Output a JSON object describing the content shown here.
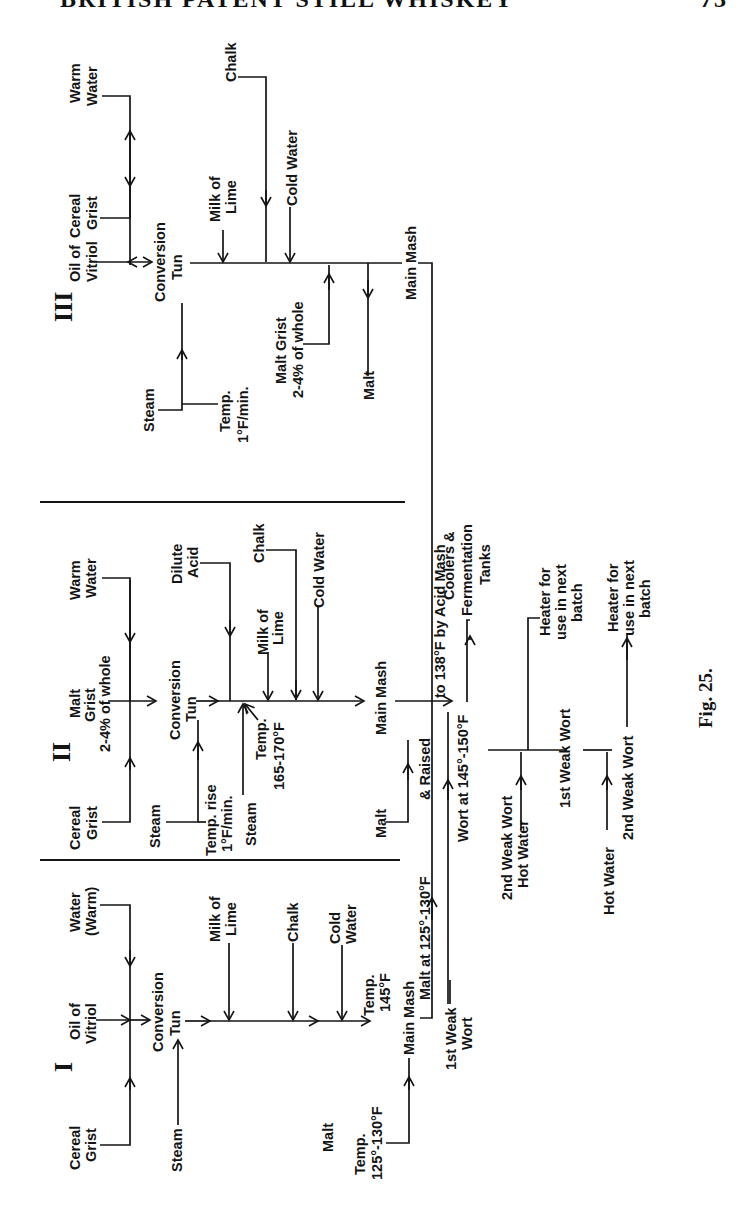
{
  "page_header": {
    "title": "BRITISH PATENT STILL WHISKEY",
    "page_number": "73"
  },
  "figure": {
    "caption": "Fig. 25."
  },
  "sections": {
    "III": {
      "numeral": "III",
      "cereal_grist": [
        "Cereal",
        "Grist"
      ],
      "oil_of_vitriol": [
        "Oil of",
        "Vitriol"
      ],
      "warm_water": [
        "Warm",
        "Water"
      ],
      "conversion_tun": [
        "Conversion",
        "Tun"
      ],
      "steam": "Steam",
      "temp_note": [
        "Temp.",
        "1°F/min."
      ],
      "milk_of_lime": [
        "Milk of",
        "Lime"
      ],
      "chalk": "Chalk",
      "cold_water": "Cold Water",
      "malt_grist": [
        "Malt Grist",
        "2-4% of whole"
      ],
      "malt": "Malt",
      "main_mash": "Main Mash"
    },
    "II": {
      "numeral": "II",
      "cereal_grist": [
        "Cereal",
        "Grist"
      ],
      "malt_grist": [
        "Malt",
        "Grist",
        "2-4% of whole"
      ],
      "warm_water": [
        "Warm",
        "Water"
      ],
      "conversion_tun": [
        "Conversion",
        "Tun"
      ],
      "steam": "Steam",
      "temp_rise": [
        "Temp. rise",
        "1°F/min."
      ],
      "steam_2": "Steam",
      "temp_note": [
        "Temp.",
        "165-170°F"
      ],
      "dilute_acid": [
        "Dilute",
        "Acid"
      ],
      "milk_of_lime": [
        "Milk of",
        "Lime"
      ],
      "chalk": "Chalk",
      "cold_water": "Cold Water",
      "main_mash": "Main Mash",
      "malt": "Malt"
    },
    "I": {
      "numeral": "I",
      "cereal_grist": [
        "Cereal",
        "Grist"
      ],
      "oil_of_vitriol": [
        "Oil of",
        "Vitriol"
      ],
      "water_warm": [
        "Water",
        "(Warm)"
      ],
      "conversion_tun": [
        "Conversion",
        "Tun"
      ],
      "steam": "Steam",
      "milk_of_lime": [
        "Milk of",
        "Lime"
      ],
      "chalk": "Chalk",
      "cold_water": [
        "Cold",
        "Water"
      ],
      "temp_note": [
        "Temp.",
        "145°F"
      ],
      "main_mash": "Main Mash",
      "malt": "Malt",
      "malt_temp": [
        "Temp.",
        "125°-130°F"
      ]
    }
  },
  "flow": {
    "raised_note": "to 138°F by Acid Mash",
    "raised_prefix": "& Raised",
    "malt_at": "Malt at 125°-130°F",
    "wort_at": "Wort at 145°-150°F",
    "first_weak_wort_in": [
      "1st Weak",
      "Wort"
    ],
    "coolers": [
      "Coolers &",
      "Fermentation",
      "Tanks"
    ],
    "second_weak_wort_hot_water": [
      "2nd Weak Wort",
      "Hot Water"
    ],
    "first_weak_wort": "1st Weak Wort",
    "heater_1": [
      "Heater for",
      "use in next",
      "batch"
    ],
    "hot_water": "Hot Water",
    "second_weak_wort": "2nd Weak Wort",
    "heater_2": [
      "Heater for",
      "use in next",
      "batch"
    ]
  }
}
